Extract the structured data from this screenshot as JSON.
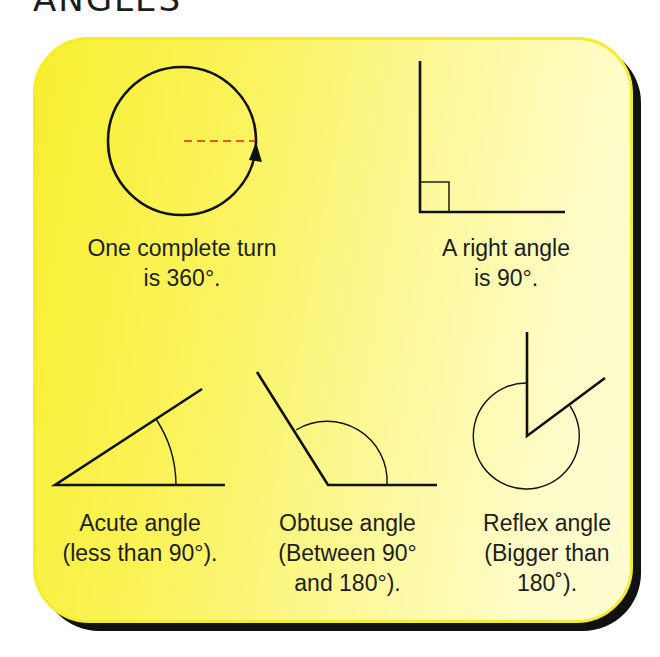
{
  "title": "ANGLES",
  "colors": {
    "card_left": "#f8ef30",
    "card_right": "#fefdd2",
    "card_border": "#f5ec2a",
    "shadow": "#111111",
    "line": "#111111",
    "dashed_radius": "#e8562a"
  },
  "figures": [
    {
      "id": "full-turn",
      "caption": [
        "One complete turn",
        "is 360°."
      ],
      "shape": "circle with dashed radius and arrow"
    },
    {
      "id": "right-angle",
      "caption": [
        "A right angle",
        "is 90°."
      ],
      "shape": "perpendicular lines with square marker"
    },
    {
      "id": "acute-angle",
      "caption": [
        "Acute angle",
        "(less than 90°)."
      ],
      "shape": "acute angle with arc"
    },
    {
      "id": "obtuse-angle",
      "caption": [
        "Obtuse angle",
        "(Between 90°",
        "and 180°)."
      ],
      "shape": "obtuse angle with arc"
    },
    {
      "id": "reflex-angle",
      "caption": [
        "Reflex angle",
        "(Bigger than",
        "180˚)."
      ],
      "shape": "reflex angle with near-full circle arc"
    }
  ]
}
